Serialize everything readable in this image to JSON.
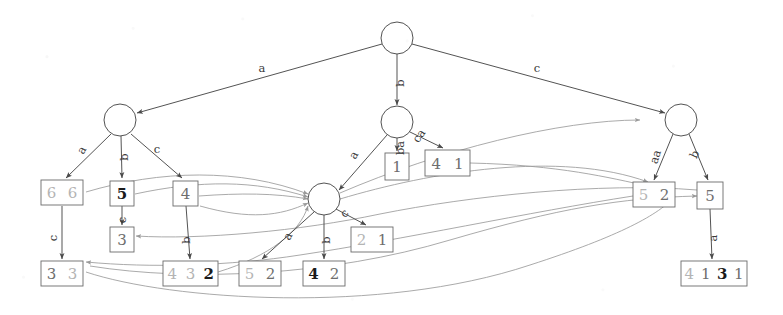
{
  "figure": {
    "type": "directed-graph-diagram",
    "title": "",
    "background_color": "#ffffff",
    "stroke_color": "#4a4a4a",
    "curve_color": "#8d8d8d"
  },
  "nodes": {
    "circles": [
      {
        "id": "root",
        "label": "",
        "cx": 397,
        "cy": 38,
        "r": 16
      },
      {
        "id": "left",
        "label": "",
        "cx": 120,
        "cy": 120,
        "r": 16
      },
      {
        "id": "mid",
        "label": "",
        "cx": 397,
        "cy": 122,
        "r": 16
      },
      {
        "id": "right",
        "label": "",
        "cx": 681,
        "cy": 120,
        "r": 16
      },
      {
        "id": "lower",
        "label": "",
        "cx": 324,
        "cy": 199,
        "r": 16
      }
    ],
    "boxes": [
      {
        "id": "b66",
        "x": 41,
        "y": 180,
        "w": 42,
        "h": 25,
        "tokens": [
          {
            "t": "6",
            "w": "light"
          },
          {
            "t": "6",
            "w": "light"
          }
        ]
      },
      {
        "id": "b5a",
        "x": 110,
        "y": 181,
        "w": 24,
        "h": 25,
        "tokens": [
          {
            "t": "5",
            "w": "bold"
          }
        ]
      },
      {
        "id": "b4a",
        "x": 173,
        "y": 181,
        "w": 25,
        "h": 25,
        "tokens": [
          {
            "t": "4",
            "w": "mid"
          }
        ]
      },
      {
        "id": "b3a",
        "x": 110,
        "y": 227,
        "w": 24,
        "h": 25,
        "tokens": [
          {
            "t": "3",
            "w": "mid"
          }
        ]
      },
      {
        "id": "b33",
        "x": 41,
        "y": 261,
        "w": 42,
        "h": 25,
        "tokens": [
          {
            "t": "3",
            "w": "mid"
          },
          {
            "t": "3",
            "w": "light"
          }
        ]
      },
      {
        "id": "b432",
        "x": 163,
        "y": 261,
        "w": 55,
        "h": 25,
        "tokens": [
          {
            "t": "4",
            "w": "light"
          },
          {
            "t": "3",
            "w": "light"
          },
          {
            "t": "2",
            "w": "bold"
          }
        ]
      },
      {
        "id": "b52a",
        "x": 239,
        "y": 261,
        "w": 42,
        "h": 25,
        "tokens": [
          {
            "t": "5",
            "w": "light"
          },
          {
            "t": "2",
            "w": "mid"
          }
        ]
      },
      {
        "id": "b42",
        "x": 303,
        "y": 261,
        "w": 42,
        "h": 25,
        "tokens": [
          {
            "t": "4",
            "w": "bold"
          },
          {
            "t": "2",
            "w": "mid"
          }
        ]
      },
      {
        "id": "b21",
        "x": 351,
        "y": 227,
        "w": 42,
        "h": 25,
        "tokens": [
          {
            "t": "2",
            "w": "light"
          },
          {
            "t": "1",
            "w": "mid"
          }
        ]
      },
      {
        "id": "b1",
        "x": 385,
        "y": 153,
        "w": 24,
        "h": 27,
        "tokens": [
          {
            "t": "1",
            "w": "mid"
          }
        ]
      },
      {
        "id": "b41",
        "x": 425,
        "y": 150,
        "w": 45,
        "h": 26,
        "tokens": [
          {
            "t": "4",
            "w": "mid"
          },
          {
            "t": "1",
            "w": "mid"
          }
        ]
      },
      {
        "id": "b52b",
        "x": 633,
        "y": 182,
        "w": 42,
        "h": 25,
        "tokens": [
          {
            "t": "5",
            "w": "light"
          },
          {
            "t": "2",
            "w": "mid"
          }
        ]
      },
      {
        "id": "b5b",
        "x": 697,
        "y": 182,
        "w": 26,
        "h": 27,
        "tokens": [
          {
            "t": "5",
            "w": "mid"
          }
        ]
      },
      {
        "id": "b4131",
        "x": 681,
        "y": 261,
        "w": 66,
        "h": 25,
        "tokens": [
          {
            "t": "4",
            "w": "light"
          },
          {
            "t": "1",
            "w": "mid"
          },
          {
            "t": "3",
            "w": "bold"
          },
          {
            "t": "1",
            "w": "mid"
          }
        ]
      }
    ]
  },
  "edges": [
    {
      "from": "root",
      "to": "left",
      "label": "a",
      "lx": 262,
      "ly": 72,
      "rot": 0
    },
    {
      "from": "root",
      "to": "mid",
      "label": "b",
      "lx": 404,
      "ly": 83,
      "rot": -90
    },
    {
      "from": "root",
      "to": "right",
      "label": "c",
      "lx": 537,
      "ly": 72,
      "rot": 0
    },
    {
      "from": "left",
      "to": "b66",
      "label": "a",
      "lx": 85,
      "ly": 152,
      "rot": -60
    },
    {
      "from": "left",
      "to": "b5a",
      "label": "b",
      "lx": 128,
      "ly": 157,
      "rot": -90
    },
    {
      "from": "left",
      "to": "b4a",
      "label": "c",
      "lx": 157,
      "ly": 153,
      "rot": 0
    },
    {
      "from": "b5a",
      "to": "b3a",
      "label": "c",
      "lx": 126,
      "ly": 220,
      "rot": -90
    },
    {
      "from": "b66",
      "to": "b33",
      "label": "c",
      "lx": 57,
      "ly": 238,
      "rot": -90
    },
    {
      "from": "b4a",
      "to": "b432",
      "label": "b",
      "lx": 190,
      "ly": 240,
      "rot": -90
    },
    {
      "from": "mid",
      "to": "lower",
      "label": "a",
      "lx": 357,
      "ly": 157,
      "rot": -60
    },
    {
      "from": "mid",
      "to": "b1",
      "label": "ba",
      "lx": 404,
      "ly": 148,
      "rot": -90
    },
    {
      "from": "mid",
      "to": "b41",
      "label": "ca",
      "lx": 422,
      "ly": 138,
      "rot": -55
    },
    {
      "from": "lower",
      "to": "b52a",
      "label": "a",
      "lx": 291,
      "ly": 238,
      "rot": -62
    },
    {
      "from": "lower",
      "to": "b42",
      "label": "b",
      "lx": 330,
      "ly": 240,
      "rot": -90
    },
    {
      "from": "lower",
      "to": "b21",
      "label": "c",
      "lx": 347,
      "ly": 216,
      "rot": -45
    },
    {
      "from": "right",
      "to": "b52b",
      "label": "aa",
      "lx": 659,
      "ly": 158,
      "rot": -72
    },
    {
      "from": "right",
      "to": "b5b",
      "label": "b",
      "lx": 698,
      "ly": 156,
      "rot": -65
    },
    {
      "from": "b5b",
      "to": "b4131",
      "label": "a",
      "lx": 717,
      "ly": 238,
      "rot": -90
    }
  ],
  "curve_edges_count": 10
}
